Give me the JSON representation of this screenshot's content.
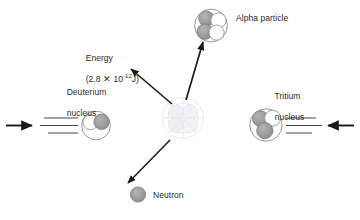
{
  "diagram": {
    "background_color": "#ffffff",
    "line_color": "#231f20",
    "nucleon_shaded_color": "#9a9a9a",
    "nucleon_plain_color": "#ffffff",
    "faint_color": "#e9e9ee"
  },
  "labels": {
    "energy_line1": "Energy",
    "energy_value_prefix": "(2.8 ",
    "energy_multiply": "✕",
    "energy_base": " 10",
    "energy_exponent": "-12",
    "energy_unit": "J)",
    "deuterium_line1": "Deuterium",
    "deuterium_line2": "nucleus",
    "tritium_line1": "Tritium",
    "tritium_line2": "nucleus",
    "alpha_particle": "Alpha particle",
    "neutron": "Neutron"
  },
  "particles": {
    "deuterium": {
      "name": "Deuterium nucleus",
      "nucleon_count": 2,
      "shaded_count": 1,
      "plain_count": 1,
      "speed_lines": 3,
      "incoming_arrow_direction": "right"
    },
    "tritium": {
      "name": "Tritium nucleus",
      "nucleon_count": 3,
      "shaded_count": 2,
      "plain_count": 1,
      "speed_lines": 3,
      "incoming_arrow_direction": "left"
    },
    "alpha": {
      "name": "Alpha particle",
      "nucleon_count": 4,
      "shaded_count": 2,
      "plain_count": 2
    },
    "neutron": {
      "name": "Neutron",
      "nucleon_count": 1,
      "shaded_count": 1,
      "plain_count": 0
    }
  },
  "arrows": [
    {
      "name": "deuterium-motion-arrow",
      "from": "left-edge",
      "to": "deuterium-nucleus",
      "direction": "right"
    },
    {
      "name": "tritium-motion-arrow",
      "from": "right-edge",
      "to": "tritium-nucleus",
      "direction": "left"
    },
    {
      "name": "energy-release-arrow",
      "from": "reaction-center",
      "to": "energy-label",
      "direction": "up-left"
    },
    {
      "name": "alpha-emission-arrow",
      "from": "reaction-center",
      "to": "alpha-particle",
      "direction": "up"
    },
    {
      "name": "neutron-emission-arrow",
      "from": "reaction-center",
      "to": "neutron",
      "direction": "down-left"
    }
  ]
}
